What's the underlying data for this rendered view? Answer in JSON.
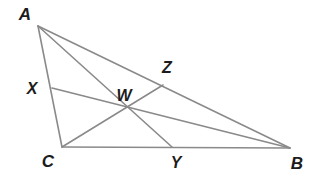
{
  "figure": {
    "kind": "euclidean-geometry-diagram",
    "background_color": "#ffffff",
    "stroke_color": "#8a8a8a",
    "stroke_width": 1.6,
    "label_color": "#1c1c1c",
    "canvas": {
      "width": 316,
      "height": 176
    }
  },
  "points": {
    "A": {
      "label": "A",
      "x": 38,
      "y": 26,
      "label_x": 25,
      "label_y": 14,
      "role": "triangle-vertex"
    },
    "B": {
      "label": "B",
      "x": 290,
      "y": 148,
      "label_x": 297,
      "label_y": 163,
      "role": "triangle-vertex"
    },
    "C": {
      "label": "C",
      "x": 62,
      "y": 147,
      "label_x": 48,
      "label_y": 161,
      "role": "triangle-vertex"
    },
    "X": {
      "label": "X",
      "x": 52,
      "y": 88,
      "label_x": 32,
      "label_y": 89,
      "role": "cevian-foot-on-AC"
    },
    "Y": {
      "label": "Y",
      "x": 172,
      "y": 147,
      "label_x": 176,
      "label_y": 163,
      "role": "cevian-foot-on-CB"
    },
    "Z": {
      "label": "Z",
      "x": 163,
      "y": 85,
      "label_x": 167,
      "label_y": 68,
      "role": "cevian-foot-on-AB"
    },
    "W": {
      "label": "W",
      "x": 130,
      "y": 108,
      "label_x": 124,
      "label_y": 96,
      "role": "concurrency-point"
    }
  },
  "segments": [
    {
      "name": "side-AB",
      "from": "A",
      "to": "B",
      "x1": 38,
      "y1": 26,
      "x2": 290,
      "y2": 148
    },
    {
      "name": "side-AC",
      "from": "A",
      "to": "C",
      "x1": 38,
      "y1": 26,
      "x2": 62,
      "y2": 147
    },
    {
      "name": "side-CB",
      "from": "C",
      "to": "B",
      "x1": 62,
      "y1": 147,
      "x2": 290,
      "y2": 148
    },
    {
      "name": "cevian-A-to-Y",
      "from": "A",
      "to": "Y",
      "x1": 38,
      "y1": 26,
      "x2": 172,
      "y2": 147
    },
    {
      "name": "cevian-C-to-Z",
      "from": "C",
      "to": "Z",
      "x1": 62,
      "y1": 147,
      "x2": 163,
      "y2": 85
    },
    {
      "name": "cevian-X-to-B",
      "from": "X",
      "to": "B",
      "x1": 52,
      "y1": 88,
      "x2": 290,
      "y2": 148
    }
  ],
  "point_order": [
    "A",
    "X",
    "C",
    "Y",
    "B",
    "Z",
    "W"
  ]
}
